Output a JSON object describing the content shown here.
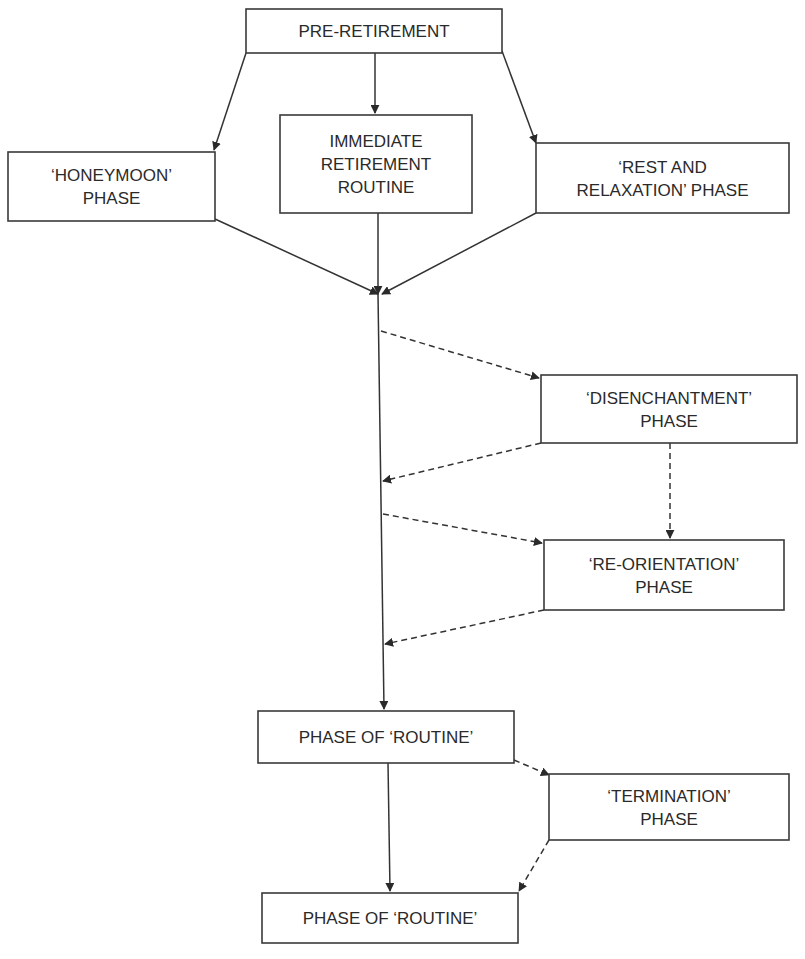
{
  "diagram": {
    "colors": {
      "stroke": "#3a3a3a",
      "text": "#2a2a2a",
      "background": "#ffffff"
    },
    "nodes": [
      {
        "id": "pre_retirement",
        "lines": [
          "PRE-RETIREMENT"
        ],
        "x": 246,
        "y": 9,
        "w": 256,
        "h": 44
      },
      {
        "id": "honeymoon",
        "lines": [
          "‘HONEYMOON’",
          "PHASE"
        ],
        "x": 8,
        "y": 152,
        "w": 207,
        "h": 69
      },
      {
        "id": "immediate_routine",
        "lines": [
          "IMMEDIATE",
          "RETIREMENT",
          "ROUTINE"
        ],
        "x": 280,
        "y": 115,
        "w": 192,
        "h": 98
      },
      {
        "id": "rest_relaxation",
        "lines": [
          "‘REST AND",
          "RELAXATION’ PHASE"
        ],
        "x": 536,
        "y": 143,
        "w": 253,
        "h": 70
      },
      {
        "id": "disenchantment",
        "lines": [
          "‘DISENCHANTMENT’",
          "PHASE"
        ],
        "x": 541,
        "y": 375,
        "w": 256,
        "h": 68
      },
      {
        "id": "reorientation",
        "lines": [
          "‘RE-ORIENTATION’",
          "PHASE"
        ],
        "x": 544,
        "y": 540,
        "w": 240,
        "h": 70
      },
      {
        "id": "routine_1",
        "lines": [
          "PHASE OF ‘ROUTINE’"
        ],
        "x": 258,
        "y": 711,
        "w": 256,
        "h": 52
      },
      {
        "id": "termination",
        "lines": [
          "‘TERMINATION’",
          "PHASE"
        ],
        "x": 549,
        "y": 774,
        "w": 240,
        "h": 66
      },
      {
        "id": "routine_2",
        "lines": [
          "PHASE OF ‘ROUTINE’"
        ],
        "x": 262,
        "y": 893,
        "w": 256,
        "h": 50
      }
    ],
    "edges": [
      {
        "from": "pre_retirement",
        "to": "honeymoon",
        "style": "solid",
        "points": [
          [
            246,
            53
          ],
          [
            214,
            150
          ]
        ]
      },
      {
        "from": "pre_retirement",
        "to": "immediate_routine",
        "style": "solid",
        "points": [
          [
            375,
            53
          ],
          [
            375,
            113
          ]
        ]
      },
      {
        "from": "pre_retirement",
        "to": "rest_relaxation",
        "style": "solid",
        "points": [
          [
            502,
            51
          ],
          [
            536,
            143
          ]
        ]
      },
      {
        "from": "honeymoon",
        "to": "convergence",
        "style": "solid",
        "points": [
          [
            215,
            219
          ],
          [
            378,
            294
          ]
        ]
      },
      {
        "from": "immediate_routine",
        "to": "convergence",
        "style": "solid",
        "points": [
          [
            378,
            213
          ],
          [
            378,
            294
          ]
        ]
      },
      {
        "from": "rest_relaxation",
        "to": "convergence",
        "style": "solid",
        "points": [
          [
            536,
            213
          ],
          [
            382,
            294
          ]
        ]
      },
      {
        "from": "convergence",
        "to": "routine_1",
        "style": "solid",
        "points": [
          [
            378,
            294
          ],
          [
            384,
            709
          ]
        ]
      },
      {
        "from": "main_line",
        "to": "disenchantment",
        "style": "dashed",
        "points": [
          [
            381,
            331
          ],
          [
            539,
            378
          ]
        ]
      },
      {
        "from": "disenchantment",
        "to": "main_line",
        "style": "dashed",
        "points": [
          [
            541,
            443
          ],
          [
            383,
            481
          ]
        ]
      },
      {
        "from": "disenchantment",
        "to": "reorientation",
        "style": "dashed",
        "points": [
          [
            670,
            443
          ],
          [
            670,
            538
          ]
        ]
      },
      {
        "from": "main_line",
        "to": "reorientation",
        "style": "dashed",
        "points": [
          [
            383,
            514
          ],
          [
            542,
            543
          ]
        ]
      },
      {
        "from": "reorientation",
        "to": "main_line",
        "style": "dashed",
        "points": [
          [
            544,
            610
          ],
          [
            385,
            644
          ]
        ]
      },
      {
        "from": "routine_1",
        "to": "termination",
        "style": "dashed",
        "points": [
          [
            514,
            760
          ],
          [
            549,
            775
          ]
        ]
      },
      {
        "from": "routine_1",
        "to": "routine_2",
        "style": "solid",
        "points": [
          [
            388,
            763
          ],
          [
            390,
            891
          ]
        ]
      },
      {
        "from": "termination",
        "to": "routine_2",
        "style": "dashed",
        "points": [
          [
            549,
            840
          ],
          [
            519,
            891
          ]
        ]
      }
    ]
  }
}
